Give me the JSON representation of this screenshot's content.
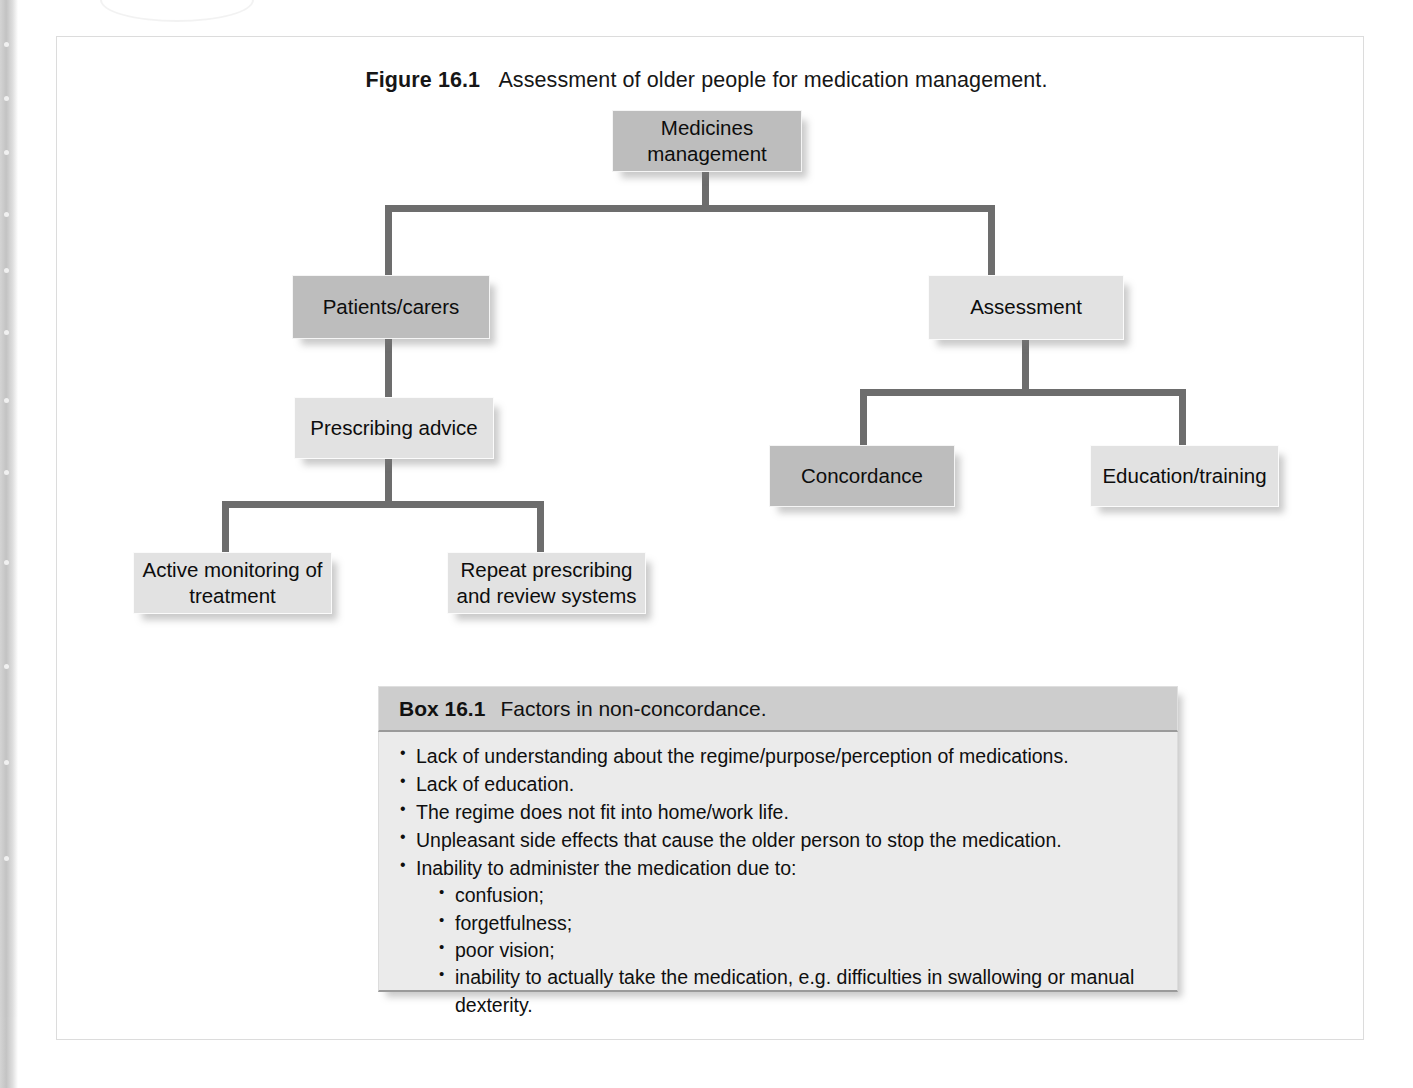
{
  "figure": {
    "label": "Figure 16.1",
    "caption": "Assessment of older people for medication management."
  },
  "flowchart": {
    "type": "tree-diagram",
    "nodes": [
      {
        "id": "medicines-management",
        "label": "Medicines\nmanagement",
        "shade": "dark",
        "level": 0
      },
      {
        "id": "patients-carers",
        "label": "Patients/carers",
        "shade": "dark",
        "level": 1
      },
      {
        "id": "assessment",
        "label": "Assessment",
        "shade": "light",
        "level": 1
      },
      {
        "id": "prescribing-advice",
        "label": "Prescribing advice",
        "shade": "light",
        "level": 2
      },
      {
        "id": "concordance",
        "label": "Concordance",
        "shade": "dark",
        "level": 2
      },
      {
        "id": "education-training",
        "label": "Education/training",
        "shade": "light",
        "level": 2
      },
      {
        "id": "active-monitoring",
        "label": "Active monitoring of\ntreatment",
        "shade": "light",
        "level": 3
      },
      {
        "id": "repeat-prescribing",
        "label": "Repeat prescribing\nand review systems",
        "shade": "light",
        "level": 3
      }
    ],
    "edges": [
      {
        "from": "medicines-management",
        "to": "patients-carers"
      },
      {
        "from": "medicines-management",
        "to": "assessment"
      },
      {
        "from": "patients-carers",
        "to": "prescribing-advice"
      },
      {
        "from": "assessment",
        "to": "concordance"
      },
      {
        "from": "assessment",
        "to": "education-training"
      },
      {
        "from": "prescribing-advice",
        "to": "active-monitoring"
      },
      {
        "from": "prescribing-advice",
        "to": "repeat-prescribing"
      }
    ],
    "node_labels": {
      "medicines_management_line1": "Medicines",
      "medicines_management_line2": "management",
      "patients_carers": "Patients/carers",
      "assessment": "Assessment",
      "prescribing_advice": "Prescribing advice",
      "concordance": "Concordance",
      "education_training": "Education/training",
      "active_monitoring_line1": "Active monitoring of",
      "active_monitoring_line2": "treatment",
      "repeat_prescribing_line1": "Repeat prescribing",
      "repeat_prescribing_line2": "and review systems"
    },
    "colors": {
      "node_dark": "#bdbdbd",
      "node_light": "#e2e2e2",
      "connector": "#6d6d6d",
      "text": "#0d0d0d"
    }
  },
  "box": {
    "label": "Box 16.1",
    "title": "Factors in non-concordance.",
    "items": [
      "Lack of understanding about the regime/purpose/perception of medications.",
      "Lack of education.",
      "The regime does not fit into home/work life.",
      "Unpleasant side effects that cause the older person to stop the medication.",
      "Inability to administer the medication due to:"
    ],
    "sub_items": [
      "confusion;",
      "forgetfulness;",
      "poor vision;",
      "inability to actually take the medication, e.g. difficulties in swallowing or manual dexterity."
    ],
    "colors": {
      "header_bg": "#cdcdcd",
      "body_bg": "#ebebeb",
      "edge": "#9a9a9a"
    }
  }
}
